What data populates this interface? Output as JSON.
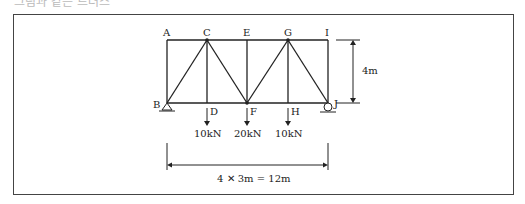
{
  "caption": "그림과 같은 트러스",
  "truss": {
    "top_nodes": [
      "A",
      "C",
      "E",
      "G",
      "I"
    ],
    "bottom_nodes": [
      "B",
      "D",
      "F",
      "H",
      "J"
    ],
    "height_label": "4m",
    "span_label": "4 ✕ 3m = 12m",
    "loads": [
      {
        "node": "D",
        "label": "10kN"
      },
      {
        "node": "F",
        "label": "20kN"
      },
      {
        "node": "H",
        "label": "10kN"
      }
    ],
    "supports": {
      "B": "pin",
      "J": "roller"
    }
  }
}
